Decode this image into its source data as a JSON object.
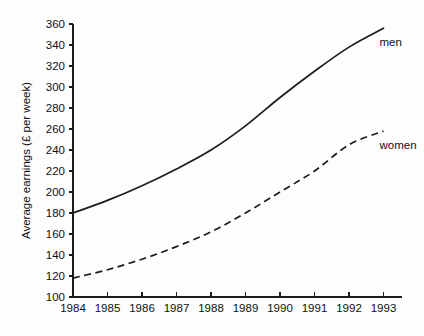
{
  "chart_data": {
    "type": "line",
    "title": "",
    "xlabel": "",
    "ylabel": "Average earnings (£ per week)",
    "categories": [
      "1984",
      "1985",
      "1986",
      "1987",
      "1988",
      "1989",
      "1990",
      "1991",
      "1992",
      "1993"
    ],
    "x": [
      1984,
      1985,
      1986,
      1987,
      1988,
      1989,
      1990,
      1991,
      1992,
      1993
    ],
    "xlim": [
      1984,
      1993
    ],
    "ylim": [
      100,
      360
    ],
    "y_ticks": [
      100,
      120,
      140,
      160,
      180,
      200,
      220,
      240,
      260,
      280,
      300,
      320,
      340,
      360
    ],
    "y_tick_labels": [
      "100",
      "120",
      "140",
      "160",
      "180",
      "200",
      "220",
      "240",
      "260",
      "280",
      "300",
      "320",
      "340",
      "360"
    ],
    "x_tick_labels": [
      "1984",
      "1985",
      "1986",
      "1987",
      "1988",
      "1989",
      "1990",
      "1991",
      "1992",
      "1993"
    ],
    "grid": false,
    "legend_position": "inline-right-of-series-end",
    "series": [
      {
        "name": "men",
        "label": "men",
        "style": "solid",
        "color": "#1c1c1c",
        "values": [
          180,
          192,
          206,
          222,
          240,
          263,
          290,
          315,
          338,
          356
        ]
      },
      {
        "name": "women",
        "label": "women",
        "style": "dashed",
        "color": "#1c1c1c",
        "values": [
          118,
          126,
          136,
          148,
          162,
          180,
          200,
          220,
          245,
          258
        ]
      }
    ]
  },
  "figure": {
    "background_color": "#fdfdfd",
    "axis_color": "#1c1c1c"
  }
}
